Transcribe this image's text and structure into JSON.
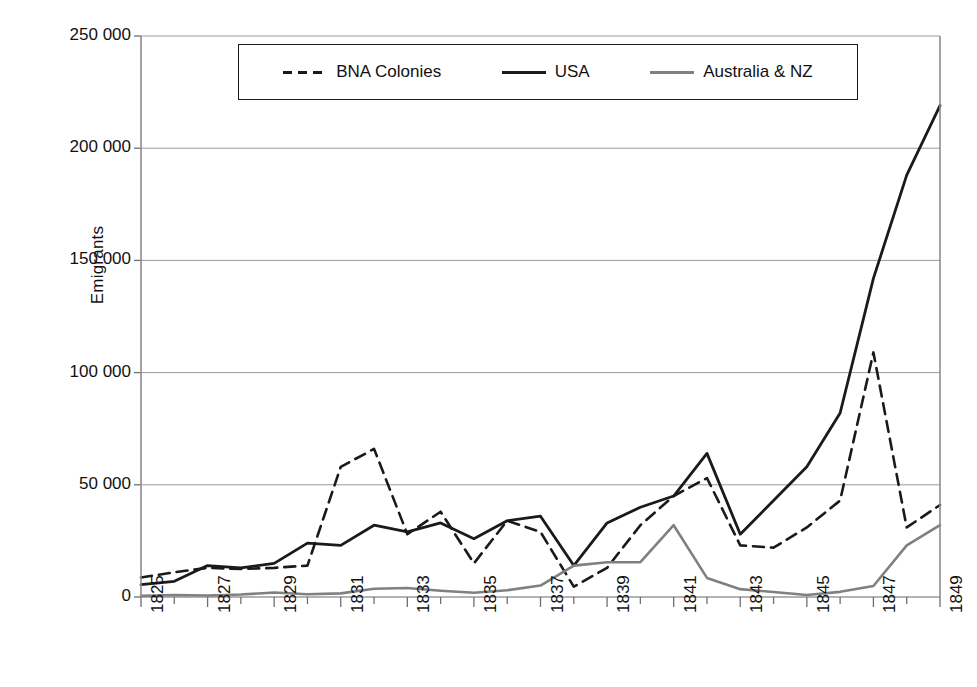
{
  "chart_data": {
    "type": "line",
    "title": "",
    "xlabel": "",
    "ylabel": "Emigrants",
    "xlim": [
      1825,
      1849
    ],
    "ylim": [
      0,
      250000
    ],
    "grid": true,
    "legend_position": "top-center",
    "x": [
      1825,
      1826,
      1827,
      1828,
      1829,
      1830,
      1831,
      1832,
      1833,
      1834,
      1835,
      1836,
      1837,
      1838,
      1839,
      1840,
      1841,
      1842,
      1843,
      1844,
      1845,
      1846,
      1847,
      1848,
      1849
    ],
    "xtick_labels": [
      "1825",
      "1827",
      "1829",
      "1831",
      "1833",
      "1835",
      "1837",
      "1839",
      "1841",
      "1843",
      "1845",
      "1847",
      "1849"
    ],
    "xtick_values": [
      1825,
      1827,
      1829,
      1831,
      1833,
      1835,
      1837,
      1839,
      1841,
      1843,
      1845,
      1847,
      1849
    ],
    "ytick_labels": [
      "0",
      "50 000",
      "100 000",
      "150 000",
      "200 000",
      "250 000"
    ],
    "ytick_values": [
      0,
      50000,
      100000,
      150000,
      200000,
      250000
    ],
    "series": [
      {
        "name": "BNA Colonies",
        "style": "dashed",
        "color": "#1a1a1a",
        "values": [
          8700,
          11000,
          13000,
          12500,
          13000,
          14000,
          58000,
          66000,
          28000,
          38000,
          15000,
          34000,
          29000,
          4600,
          13000,
          32000,
          45000,
          53000,
          23000,
          22000,
          31000,
          43000,
          109000,
          31000,
          41000
        ]
      },
      {
        "name": "USA",
        "style": "solid",
        "color": "#1a1a1a",
        "values": [
          5500,
          7000,
          14000,
          13000,
          15000,
          24000,
          23000,
          32000,
          29000,
          33000,
          26000,
          34000,
          36000,
          14000,
          33000,
          40000,
          45000,
          64000,
          28000,
          43000,
          58000,
          82000,
          142000,
          188000,
          219000
        ]
      },
      {
        "name": "Australia & NZ",
        "style": "solid",
        "color": "#808080",
        "values": [
          500,
          900,
          700,
          1100,
          2000,
          1200,
          1600,
          3700,
          4000,
          2800,
          1900,
          3000,
          5100,
          14000,
          15500,
          15500,
          32000,
          8500,
          3500,
          2200,
          900,
          2300,
          4900,
          23000,
          32000
        ]
      }
    ]
  },
  "legend": {
    "items": [
      {
        "label": "BNA Colonies",
        "style": "dashed",
        "color": "#1a1a1a"
      },
      {
        "label": "USA",
        "style": "solid",
        "color": "#1a1a1a"
      },
      {
        "label": "Australia & NZ",
        "style": "solid",
        "color": "#808080"
      }
    ]
  },
  "axes": {
    "y_title": "Emigrants"
  }
}
